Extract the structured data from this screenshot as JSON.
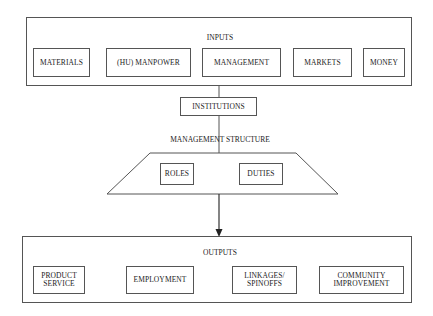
{
  "inputs": {
    "title": "INPUTS",
    "items": [
      {
        "label": "MATERIALS"
      },
      {
        "label": "(HU) MANPOWER"
      },
      {
        "label": "MANAGEMENT"
      },
      {
        "label": "MARKETS"
      },
      {
        "label": "MONEY"
      }
    ]
  },
  "institutions": {
    "label": "INSTITUTIONS"
  },
  "management_structure": {
    "title": "MANAGEMENT STRUCTURE",
    "items": [
      {
        "label": "ROLES"
      },
      {
        "label": "DUTIES"
      }
    ]
  },
  "outputs": {
    "title": "OUTPUTS",
    "items": [
      {
        "label": "PRODUCT\nSERVICE"
      },
      {
        "label": "EMPLOYMENT"
      },
      {
        "label": "LINKAGES/\nSPINOFFS"
      },
      {
        "label": "COMMUNITY\nIMPROVEMENT"
      }
    ]
  },
  "colors": {
    "line": "#555555",
    "background": "#ffffff",
    "text": "#222222"
  }
}
